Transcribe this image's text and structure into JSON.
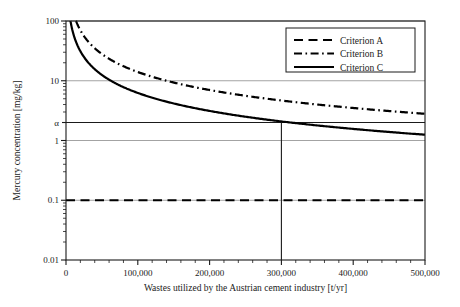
{
  "chart_data": {
    "type": "line",
    "title": "",
    "xlabel": "Wastes utilized by the Austrian cement industry [t/yr]",
    "ylabel": "Mercury concentration [mg/kg]",
    "xlim": [
      0,
      500000
    ],
    "ylim": [
      0.01,
      100
    ],
    "yscale": "log",
    "xscale": "linear",
    "grid": "horizontal gridlines at y = 0.1, 1, alpha, 10, 100",
    "legend_position": "top-right inside plot",
    "xticks": [
      "0",
      "100,000",
      "200,000",
      "300,000",
      "400,000",
      "500,000"
    ],
    "xtick_values": [
      0,
      100000,
      200000,
      300000,
      400000,
      500000
    ],
    "xminor_per_interval": 4,
    "yticks": [
      "0.01",
      "0.1",
      "1",
      "α",
      "10",
      "100"
    ],
    "ytick_values": [
      0.01,
      0.1,
      1,
      2.0,
      10,
      100
    ],
    "alpha_label": "α",
    "alpha_value": 2.0,
    "annotations": [
      {
        "name": "alpha-gridline",
        "type": "hline",
        "y": 2.0
      },
      {
        "name": "intersection-vertical-line",
        "type": "vline",
        "x": 300000,
        "note": "Criterion C crosses alpha at 300,000 t/yr"
      }
    ],
    "series": [
      {
        "name": "Criterion A",
        "style": "dashed",
        "color": "#000000",
        "model": "constant",
        "constant": 0.1,
        "x": [
          0,
          50000,
          100000,
          150000,
          200000,
          250000,
          300000,
          350000,
          400000,
          450000,
          500000
        ],
        "values": [
          0.1,
          0.1,
          0.1,
          0.1,
          0.1,
          0.1,
          0.1,
          0.1,
          0.1,
          0.1,
          0.1
        ]
      },
      {
        "name": "Criterion B",
        "style": "dash-dot",
        "color": "#000000",
        "model": "hyperbolic: y = 1400000 / x",
        "x": [
          14000,
          20000,
          30000,
          50000,
          75000,
          100000,
          150000,
          200000,
          250000,
          300000,
          350000,
          400000,
          450000,
          500000
        ],
        "values": [
          100,
          70,
          46.7,
          28,
          18.7,
          14,
          9.3,
          7.0,
          5.6,
          4.7,
          4.0,
          3.5,
          3.1,
          2.8
        ]
      },
      {
        "name": "Criterion C",
        "style": "solid",
        "color": "#000000",
        "model": "hyperbolic: y = 625000 / x",
        "x": [
          6250,
          10000,
          15000,
          25000,
          40000,
          60000,
          100000,
          150000,
          200000,
          250000,
          300000,
          350000,
          400000,
          450000,
          500000
        ],
        "values": [
          100,
          62.5,
          41.7,
          25.0,
          15.6,
          10.4,
          6.25,
          4.17,
          3.13,
          2.5,
          2.08,
          1.79,
          1.56,
          1.39,
          1.25
        ]
      }
    ]
  },
  "legend": {
    "items": [
      {
        "label": "Criterion A",
        "style": "dashed"
      },
      {
        "label": "Criterion B",
        "style": "dash-dot"
      },
      {
        "label": "Criterion C",
        "style": "solid"
      }
    ]
  }
}
